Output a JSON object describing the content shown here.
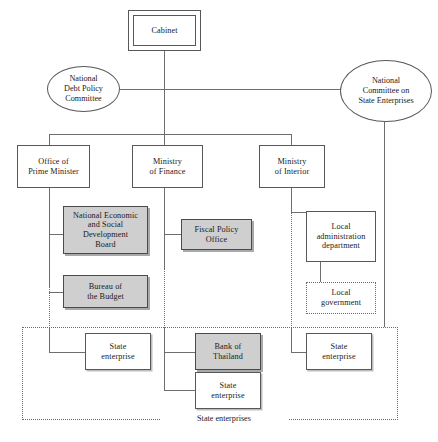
{
  "diagram": {
    "accent_shaded": "#cfcfcf",
    "line_color": "#6e6e70",
    "border_color": "#58585a",
    "background": "#ffffff"
  },
  "nodes": {
    "cabinet": "Cabinet",
    "national_debt_policy_committee": "National\nDebt Policy\nCommittee",
    "national_committee_state_enterprises": "National\nCommittee on\nState Enterprises",
    "office_prime_minister": "Office of\nPrime Minister",
    "ministry_finance": "Ministry\nof Finance",
    "ministry_interior": "Ministry\nof Interior",
    "nesdb": "National Economic\nand Social\nDevelopment\nBoard",
    "bureau_budget": "Bureau of\nthe Budget",
    "fiscal_policy_office": "Fiscal Policy\nOffice",
    "local_administration_department": "Local\nadministration\ndepartment",
    "local_government": "Local\ngovernment",
    "state_enterprise_left": "State\nenterprise",
    "bank_of_thailand": "Bank of\nThailand",
    "state_enterprise_center": "State\nenterprise",
    "state_enterprise_right": "State\nenterprise"
  },
  "groups": {
    "state_enterprises_label": "State enterprises"
  }
}
